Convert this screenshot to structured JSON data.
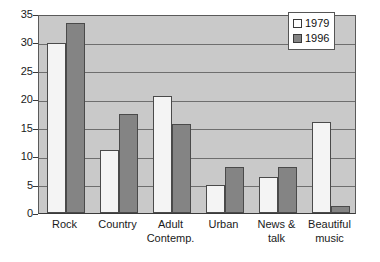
{
  "chart_data": {
    "type": "bar",
    "title": "",
    "subtitle": "",
    "xlabel": "",
    "ylabel": "",
    "ylim": [
      0,
      35
    ],
    "yticks": [
      0,
      5,
      10,
      15,
      20,
      25,
      30,
      35
    ],
    "ytick_labels": [
      "0",
      "5",
      "10",
      "15",
      "20",
      "25",
      "30",
      "35"
    ],
    "grid": true,
    "grid_axis": "y",
    "legend_position": "top-right",
    "categories": [
      "Rock",
      "Country",
      "Adult Contemp.",
      "Urban",
      "News & talk",
      "Beautiful music"
    ],
    "category_lines": [
      [
        "Rock",
        ""
      ],
      [
        "Country",
        ""
      ],
      [
        "Adult",
        "Contemp."
      ],
      [
        "Urban",
        ""
      ],
      [
        "News &",
        "talk"
      ],
      [
        "Beautiful",
        "music"
      ]
    ],
    "series": [
      {
        "name": "1979",
        "color": "#f4f4f4",
        "values": [
          29.9,
          11.0,
          20.5,
          5.0,
          6.4,
          16.0
        ]
      },
      {
        "name": "1996",
        "color": "#848484",
        "values": [
          33.4,
          17.5,
          15.6,
          8.1,
          8.1,
          1.3
        ]
      }
    ]
  },
  "legend": {
    "items": [
      {
        "label": "1979",
        "swatch": "light-square-swatch"
      },
      {
        "label": "1996",
        "swatch": "dark-square-swatch"
      }
    ]
  },
  "colors": {
    "plot_background": "#c9c9c9",
    "page_background": "#ffffff",
    "gridline": "#6e6e6e",
    "axis": "#3a3a3a",
    "series_1979": "#f4f4f4",
    "series_1996": "#848484",
    "text": "#1a1a1a"
  }
}
